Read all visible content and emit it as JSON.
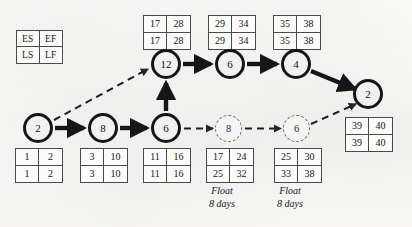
{
  "diagram": {
    "legend": {
      "name": "activity-time-legend",
      "es": "ES",
      "ef": "EF",
      "ls": "LS",
      "lf": "LF"
    },
    "colors": {
      "background": "#f7f7f6",
      "node_stroke": "#16161a",
      "dashed_stroke": "#6d6d6d",
      "box_stroke": "#4a4a4a",
      "text": "#15151a"
    },
    "nodes": [
      {
        "id": "n-start-2",
        "duration": "2",
        "style": "solid",
        "x": 38,
        "y": 128
      },
      {
        "id": "n-8",
        "duration": "8",
        "style": "solid",
        "x": 103,
        "y": 128
      },
      {
        "id": "n-6-lower",
        "duration": "6",
        "style": "solid",
        "x": 166,
        "y": 128
      },
      {
        "id": "n-12",
        "duration": "12",
        "style": "solid",
        "x": 166,
        "y": 64
      },
      {
        "id": "n-6-upper",
        "duration": "6",
        "style": "solid",
        "x": 230,
        "y": 64
      },
      {
        "id": "n-4",
        "duration": "4",
        "style": "solid",
        "x": 296,
        "y": 64
      },
      {
        "id": "n-end-2",
        "duration": "2",
        "style": "solid",
        "x": 368,
        "y": 94
      },
      {
        "id": "n-float-8",
        "duration": "8",
        "style": "dashed",
        "x": 229,
        "y": 129
      },
      {
        "id": "n-float-6",
        "duration": "6",
        "style": "dashed",
        "x": 297,
        "y": 129
      }
    ],
    "time_boxes": [
      {
        "id": "box-start-2",
        "es": "1",
        "ef": "2",
        "ls": "1",
        "lf": "2",
        "x": 15,
        "y": 148
      },
      {
        "id": "box-8",
        "es": "3",
        "ef": "10",
        "ls": "3",
        "lf": "10",
        "x": 80,
        "y": 148
      },
      {
        "id": "box-6-lower",
        "es": "11",
        "ef": "16",
        "ls": "11",
        "lf": "16",
        "x": 143,
        "y": 148
      },
      {
        "id": "box-12",
        "es": "17",
        "ef": "28",
        "ls": "17",
        "lf": "28",
        "x": 143,
        "y": 15
      },
      {
        "id": "box-6-upper",
        "es": "29",
        "ef": "34",
        "ls": "29",
        "lf": "34",
        "x": 208,
        "y": 15
      },
      {
        "id": "box-4",
        "es": "35",
        "ef": "38",
        "ls": "35",
        "lf": "38",
        "x": 273,
        "y": 15
      },
      {
        "id": "box-end-2",
        "es": "39",
        "ef": "40",
        "ls": "39",
        "lf": "40",
        "x": 345,
        "y": 117
      },
      {
        "id": "box-float-8",
        "es": "17",
        "ef": "24",
        "ls": "25",
        "lf": "32",
        "x": 206,
        "y": 148
      },
      {
        "id": "box-float-6",
        "es": "25",
        "ef": "30",
        "ls": "33",
        "lf": "38",
        "x": 274,
        "y": 148
      }
    ],
    "float_labels": [
      {
        "id": "float-caption-8",
        "line1": "Float",
        "line2": "8 days",
        "x": 187,
        "y": 185
      },
      {
        "id": "float-caption-6",
        "line1": "Float",
        "line2": "8 days",
        "x": 255,
        "y": 185
      }
    ],
    "edges": [
      {
        "id": "edge-start2-to-8",
        "style": "solid",
        "from": "n-start-2",
        "to": "n-8"
      },
      {
        "id": "edge-8-to-6lower",
        "style": "solid",
        "from": "n-8",
        "to": "n-6-lower"
      },
      {
        "id": "edge-6lower-to-12",
        "style": "solid",
        "from": "n-6-lower",
        "to": "n-12"
      },
      {
        "id": "edge-start2-to-12",
        "style": "dashed",
        "from": "n-start-2",
        "to": "n-12"
      },
      {
        "id": "edge-12-to-6upper",
        "style": "solid",
        "from": "n-12",
        "to": "n-6-upper"
      },
      {
        "id": "edge-6upper-to-4",
        "style": "solid",
        "from": "n-6-upper",
        "to": "n-4"
      },
      {
        "id": "edge-4-to-end2",
        "style": "solid",
        "from": "n-4",
        "to": "n-end-2"
      },
      {
        "id": "edge-6lower-to-float8",
        "style": "dashed",
        "from": "n-6-lower",
        "to": "n-float-8"
      },
      {
        "id": "edge-float8-to-float6",
        "style": "dashed",
        "from": "n-float-8",
        "to": "n-float-6"
      },
      {
        "id": "edge-float6-to-end2",
        "style": "dashed",
        "from": "n-float-6",
        "to": "n-end-2"
      }
    ]
  }
}
